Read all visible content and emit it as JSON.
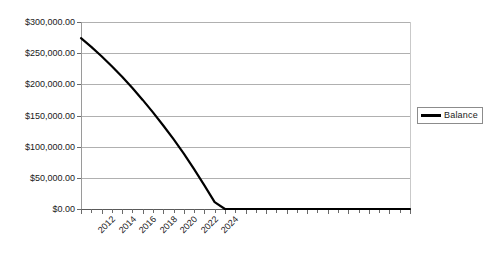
{
  "chart_data": {
    "type": "line",
    "title": "",
    "xlabel": "",
    "ylabel": "",
    "grid": true,
    "legend_position": "right",
    "ylim": [
      0,
      300000
    ],
    "y_ticks": [
      0,
      50000,
      100000,
      150000,
      200000,
      250000,
      300000
    ],
    "y_tick_labels": [
      "$0.00",
      "$50,000.00",
      "$100,000.00",
      "$150,000.00",
      "$200,000.00",
      "$250,000.00",
      "$300,000.00"
    ],
    "xlim": [
      2012,
      2044
    ],
    "x_tick_labels": [
      "2012",
      "2014",
      "2016",
      "2018",
      "2020",
      "2022",
      "2024"
    ],
    "x_all_years": [
      2012,
      2013,
      2014,
      2015,
      2016,
      2017,
      2018,
      2019,
      2020,
      2021,
      2022,
      2023,
      2024,
      2025,
      2026,
      2027,
      2028,
      2029,
      2030,
      2031,
      2032,
      2033,
      2034,
      2035,
      2036,
      2037,
      2038,
      2039,
      2040,
      2041,
      2042,
      2043,
      2044
    ],
    "series": [
      {
        "name": "Balance",
        "color": "#000000",
        "x": [
          2012,
          2013,
          2014,
          2015,
          2016,
          2017,
          2018,
          2019,
          2020,
          2021,
          2022,
          2023,
          2024,
          2025,
          2026,
          2027,
          2028,
          2029,
          2030,
          2031,
          2032,
          2033,
          2034,
          2035,
          2036,
          2037,
          2038,
          2039,
          2040,
          2041,
          2042,
          2043,
          2044
        ],
        "values": [
          274000,
          260000,
          245000,
          229000,
          212000,
          194000,
          175000,
          155000,
          134000,
          112000,
          89000,
          64000,
          38000,
          11000,
          0,
          0,
          0,
          0,
          0,
          0,
          0,
          0,
          0,
          0,
          0,
          0,
          0,
          0,
          0,
          0,
          0,
          0,
          0
        ]
      }
    ],
    "legend": [
      {
        "label": "Balance",
        "color": "#000000"
      }
    ]
  },
  "legend": {
    "balance_label": "Balance"
  }
}
